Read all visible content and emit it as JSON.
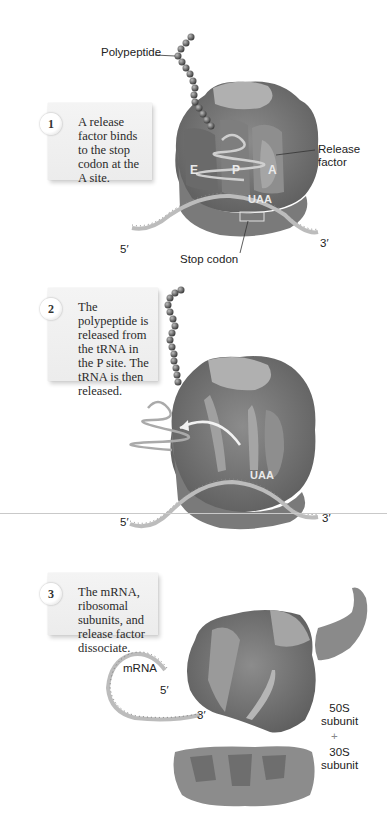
{
  "header": {
    "page_number": "",
    "section": ""
  },
  "steps": [
    {
      "number": "1",
      "text": "A release factor binds to the stop codon at the A site.",
      "labels": {
        "polypeptide": "Polypeptide",
        "release_factor_line1": "Release",
        "release_factor_line2": "factor",
        "stop_codon": "Stop codon",
        "five_prime": "5′",
        "three_prime": "3′",
        "site_e": "E",
        "site_p": "P",
        "site_a": "A",
        "codon": "UAA"
      }
    },
    {
      "number": "2",
      "text": "The polypeptide is released from the tRNA in the P site. The tRNA is then released.",
      "labels": {
        "five_prime": "5′",
        "three_prime": "3′",
        "codon": "UAA"
      }
    },
    {
      "number": "3",
      "text": "The mRNA, ribosomal subunits, and release factor dissociate.",
      "labels": {
        "mrna": "mRNA",
        "five_prime": "5′",
        "three_prime": "3′",
        "large_subunit_line1": "50S",
        "large_subunit_line2": "subunit",
        "plus": "+",
        "small_subunit_line1": "30S",
        "small_subunit_line2": "subunit"
      }
    }
  ],
  "colors": {
    "background": "#ffffff",
    "ribosome_dark": "#6e6e6e",
    "ribosome_mid": "#8a8a8a",
    "ribosome_light": "#b5b5b5",
    "card_bg": "#f0f0f0",
    "text": "#222222"
  }
}
